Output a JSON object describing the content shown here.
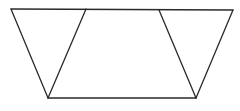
{
  "figure": {
    "stroke_color": "#2a2a2a",
    "background": "#ffffff",
    "vertices": {
      "top_left": [
        11,
        9
      ],
      "top_inner_left": [
        86,
        9
      ],
      "top_inner_right": [
        159,
        10
      ],
      "top_right": [
        233,
        10
      ],
      "bottom_left": [
        48,
        98
      ],
      "bottom_right": [
        196,
        98
      ]
    },
    "segments": [
      {
        "name": "top-edge",
        "from": "top_left",
        "to": "top_right"
      },
      {
        "name": "bottom-edge",
        "from": "bottom_left",
        "to": "bottom_right"
      },
      {
        "name": "left-outer-edge",
        "from": "top_left",
        "to": "bottom_left"
      },
      {
        "name": "left-inner-edge",
        "from": "top_inner_left",
        "to": "bottom_left"
      },
      {
        "name": "right-inner-edge",
        "from": "top_inner_right",
        "to": "bottom_right"
      },
      {
        "name": "right-outer-edge",
        "from": "top_right",
        "to": "bottom_right"
      }
    ]
  }
}
